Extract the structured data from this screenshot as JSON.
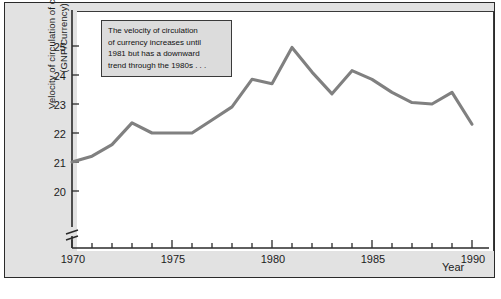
{
  "chart_data": {
    "type": "line",
    "title": "",
    "xlabel": "Year",
    "ylabel": "Velocity of circulation of currency (GNP/Currency)",
    "ylabel_lines": [
      "Velocity of circulation of currency",
      "(GNP/Currency)"
    ],
    "xlim": [
      1970,
      1990
    ],
    "ylim": [
      19.6,
      25.4
    ],
    "yticks": [
      20,
      21,
      22,
      23,
      24,
      25
    ],
    "ytick_labels": [
      "20",
      "21",
      "22",
      "23",
      "24",
      "25"
    ],
    "xticks": [
      1970,
      1975,
      1980,
      1985,
      1990
    ],
    "xtick_labels": [
      "1970",
      "1975",
      "1980",
      "1985",
      "1990"
    ],
    "x_minor_tick_interval": 1,
    "grid": false,
    "legend": false,
    "y_axis_break": true,
    "line_color": "#808080",
    "x": [
      1970,
      1971,
      1972,
      1973,
      1974,
      1975,
      1976,
      1977,
      1978,
      1979,
      1980,
      1981,
      1982,
      1983,
      1984,
      1985,
      1986,
      1987,
      1988,
      1989,
      1990
    ],
    "values": [
      21.0,
      21.2,
      21.6,
      22.35,
      22.0,
      22.0,
      22.0,
      22.45,
      22.9,
      23.85,
      23.7,
      24.95,
      24.1,
      23.35,
      24.15,
      23.85,
      23.4,
      23.05,
      23.0,
      23.4,
      22.3
    ],
    "annotations": [
      {
        "name": "velocity-trend-note",
        "lines": [
          "The velocity of circulation",
          "of currency increases until",
          "1981 but has a downward",
          "trend through the 1980s . . ."
        ]
      }
    ]
  },
  "colors": {
    "line": "#808080",
    "axis": "#2a2a2a",
    "panel_background": "#e2e2e2",
    "plot_background": "#ffffff",
    "annotation_background": "#dcdcdc",
    "text": "#1c1c1c"
  }
}
